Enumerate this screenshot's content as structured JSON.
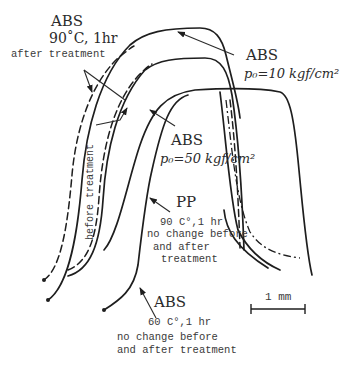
{
  "diagram": {
    "type": "cross-section profile comparison",
    "labels": {
      "abs_90": {
        "title": "ABS",
        "condition": "90˚C, 1hr",
        "note": "after treatment"
      },
      "before_treatment": "before treatment",
      "abs_10": {
        "title": "ABS",
        "pressure": "p₀=10 kgf/cm²"
      },
      "abs_50": {
        "title": "ABS",
        "pressure": "p₀=50 kgf/cm²"
      },
      "pp_90": {
        "title": "PP",
        "condition": "90 C°,1 hr",
        "note_line1": "no change before",
        "note_line2": "and after",
        "note_line3": "treatment"
      },
      "abs_60": {
        "title": "ABS",
        "condition": "60 C°,1 hr",
        "note_line1": "no change before",
        "note_line2": "and after treatment"
      },
      "scale_bar": "1 mm"
    },
    "profiles": [
      {
        "name": "ABS 90°C after treatment (outer)",
        "style": "solid"
      },
      {
        "name": "ABS 90°C before treatment (outer)",
        "style": "dashed"
      },
      {
        "name": "ABS p0=10 kgf/cm2 after treatment",
        "style": "solid"
      },
      {
        "name": "ABS p0=10 kgf/cm2 before treatment",
        "style": "dashed"
      },
      {
        "name": "ABS p0=50 kgf/cm2",
        "style": "dash-dot"
      },
      {
        "name": "PP 90°C",
        "style": "solid"
      },
      {
        "name": "ABS 60°C",
        "style": "solid"
      }
    ]
  }
}
